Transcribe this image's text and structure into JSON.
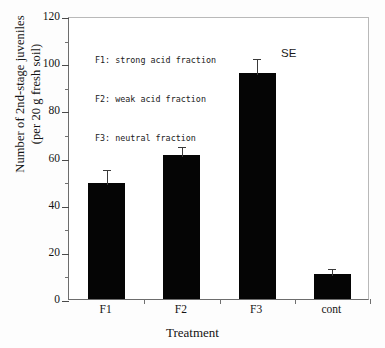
{
  "chart_data": {
    "type": "bar",
    "title": "",
    "xlabel": "Treatment",
    "ylabel_line1": "Number of 2nd-stage juveniles",
    "ylabel_line2": "(per 20 g fresh soil)",
    "categories": [
      "F1",
      "F2",
      "F3",
      "cont"
    ],
    "values": [
      49,
      61,
      96,
      10.5
    ],
    "errors": [
      6.5,
      4.5,
      6.5,
      3
    ],
    "ylim": [
      0,
      120
    ],
    "ytick_labels": [
      "0",
      "20",
      "40",
      "60",
      "80",
      "100",
      "120"
    ],
    "ytick_values": [
      0,
      20,
      40,
      60,
      80,
      100,
      120
    ],
    "yminor_values": [
      10,
      30,
      50,
      70,
      90,
      110
    ],
    "grid": false,
    "legend_position": "upper-left-inside",
    "annotations": [
      {
        "text": "SE",
        "near_category": "F3",
        "meaning": "standard-error-bar-label"
      }
    ],
    "legend_entries": [
      "F1: strong acid fraction",
      "F2: weak acid fraction",
      "F3: neutral fraction"
    ],
    "bar_color": "#050505",
    "error_bar_color": "#3a3a3a",
    "axis_color": "#6d6d6d",
    "background_color": "#ffffff"
  }
}
